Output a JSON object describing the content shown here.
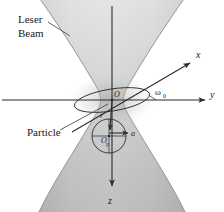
{
  "figure": {
    "background_color": "#ffffff",
    "width": 224,
    "height": 212,
    "labels": {
      "laser_line1": "Leser",
      "laser_line2": "Beam",
      "particle": "Particle",
      "axis_x": "x",
      "axis_y": "y",
      "axis_z": "z",
      "origin": "O",
      "particle_center": "O",
      "particle_center_sub": "p",
      "radius_vector": "r",
      "particle_radius": "a",
      "beam_waist": "ω",
      "beam_waist_sub": "0"
    },
    "colors": {
      "ink": "#2b2b2b",
      "beam_light": "#e8e8e8",
      "beam_mid": "#c9c9c9",
      "beam_dark": "#a8a8a8",
      "background": "#ffffff"
    },
    "elements": {
      "beam_shape": "hourglass-gaussian-waist",
      "waist_cross_section": "ellipse",
      "particle_shape": "circle"
    }
  }
}
